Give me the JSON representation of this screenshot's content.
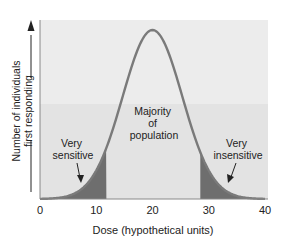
{
  "chart_data": {
    "type": "area",
    "title": "",
    "xlabel": "Dose (hypothetical units)",
    "ylabel_line1": "Number of individuals",
    "ylabel_line2": "first responding",
    "xlim": [
      0,
      40
    ],
    "xticks": [
      0,
      10,
      20,
      30,
      40
    ],
    "xtick_labels": [
      "0",
      "10",
      "20",
      "30",
      "40"
    ],
    "distribution": {
      "shape": "normal",
      "mean": 20,
      "sd": 5.3
    },
    "x": [
      0,
      2,
      4,
      6,
      8,
      10,
      12,
      14,
      16,
      18,
      20,
      22,
      24,
      26,
      28,
      30,
      32,
      34,
      36,
      38,
      40
    ],
    "values": [
      0.01,
      0.02,
      0.05,
      0.11,
      0.22,
      0.36,
      0.55,
      0.73,
      0.88,
      0.97,
      1.0,
      0.97,
      0.88,
      0.73,
      0.55,
      0.36,
      0.22,
      0.11,
      0.05,
      0.02,
      0.01
    ],
    "shaded_regions": [
      {
        "from": 0,
        "to": 11.8,
        "label": "Very sensitive"
      },
      {
        "from": 28.5,
        "to": 40,
        "label": "Very insensitive"
      }
    ],
    "annotations": [
      {
        "text": "Very sensitive",
        "x": 8,
        "arrow": true
      },
      {
        "text": "Majority of population",
        "x": 20,
        "arrow": false
      },
      {
        "text": "Very insensitive",
        "x": 32,
        "arrow": true
      }
    ],
    "grid": false,
    "legend": "none"
  },
  "labels": {
    "very_sensitive_1": "Very",
    "very_sensitive_2": "sensitive",
    "majority_1": "Majority",
    "majority_2": "of",
    "majority_3": "population",
    "very_insensitive_1": "Very",
    "very_insensitive_2": "insensitive"
  },
  "colors": {
    "band_upper": "#ececec",
    "band_lower": "#e2e2e2",
    "curve": "#7a7a7a",
    "shade": "#6f6f6f",
    "axis": "#444444"
  }
}
